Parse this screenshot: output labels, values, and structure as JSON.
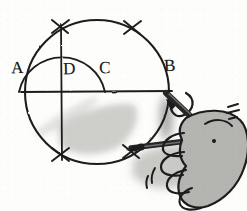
{
  "figure": {
    "medium": "pencil sketch",
    "background_color": "#fdfdfc",
    "ink_color": "#1f1f1f",
    "shadow_color": "#9a9a96"
  },
  "labels": [
    {
      "id": "A",
      "text": "A",
      "x": 11,
      "y": 59,
      "description": "left end of horizontal diameter"
    },
    {
      "id": "D",
      "text": "D",
      "x": 63,
      "y": 60,
      "description": "point on diameter at vertical line"
    },
    {
      "id": "C",
      "text": "C",
      "x": 99,
      "y": 59,
      "description": "center point where inner arc meets diameter"
    },
    {
      "id": "B",
      "text": "B",
      "x": 164,
      "y": 57,
      "description": "right end of diameter, compass point"
    }
  ],
  "geometry": {
    "main_circle": {
      "cx": 97,
      "cy": 92,
      "r": 72,
      "label": "main-circle"
    },
    "diameter_line": {
      "x1": 22,
      "y1": 92,
      "x2": 172,
      "y2": 91,
      "label": "horizontal-diameter-A-B"
    },
    "vertical_line": {
      "x1": 61,
      "y1": 24,
      "x2": 62,
      "y2": 160,
      "label": "vertical-chord-through-D"
    },
    "inner_arc": {
      "cx": 61,
      "cy": 92,
      "r": 44,
      "from_deg": 180,
      "to_deg": 0,
      "label": "semicircle-arc-A-to-C"
    },
    "tick_marks": [
      {
        "id": "tick-upper-left",
        "x": 60,
        "y": 26,
        "angle": -38
      },
      {
        "id": "tick-upper-right",
        "x": 132,
        "y": 28,
        "angle": 38
      },
      {
        "id": "tick-lower-left",
        "x": 60,
        "y": 155,
        "angle": 38
      },
      {
        "id": "tick-lower-right",
        "x": 131,
        "y": 152,
        "angle": -38
      }
    ]
  },
  "annotations": {
    "rotation_arrow": {
      "id": "compass-rotation-arrow",
      "description": "curved arrow at point B showing sweep direction",
      "tip_x": 171,
      "tip_y": 110
    },
    "motion_marks": {
      "id": "motion-speed-lines",
      "count": 3,
      "description": "short speed lines beside the hand"
    },
    "finger_motion_marks": {
      "id": "finger-motion-marks",
      "count": 2,
      "description": "small arcs below the fingers"
    }
  },
  "tool": {
    "name": "compass",
    "parts": [
      {
        "id": "compass-upper-leg",
        "description": "pencil leg angled up-left toward B"
      },
      {
        "id": "compass-lower-leg",
        "description": "needle leg pointing left into the circle"
      },
      {
        "id": "compass-hinge",
        "description": "pivot joint where the legs meet"
      },
      {
        "id": "compass-needle-tip",
        "description": "sharp point at left end of lower leg"
      }
    ]
  },
  "hand": {
    "id": "hand-holding-compass",
    "description": "right hand gripping the compass at lower right",
    "fill": "#b4b4b0",
    "fingers": 4
  },
  "shading": [
    {
      "id": "shadow-under-circle",
      "description": "soft gray smudge shadow inside lower circle"
    },
    {
      "id": "shadow-under-hand",
      "description": "gray cast shadow beneath the hand"
    },
    {
      "id": "shadow-below-B",
      "description": "vertical gray smudge under point B"
    }
  ]
}
